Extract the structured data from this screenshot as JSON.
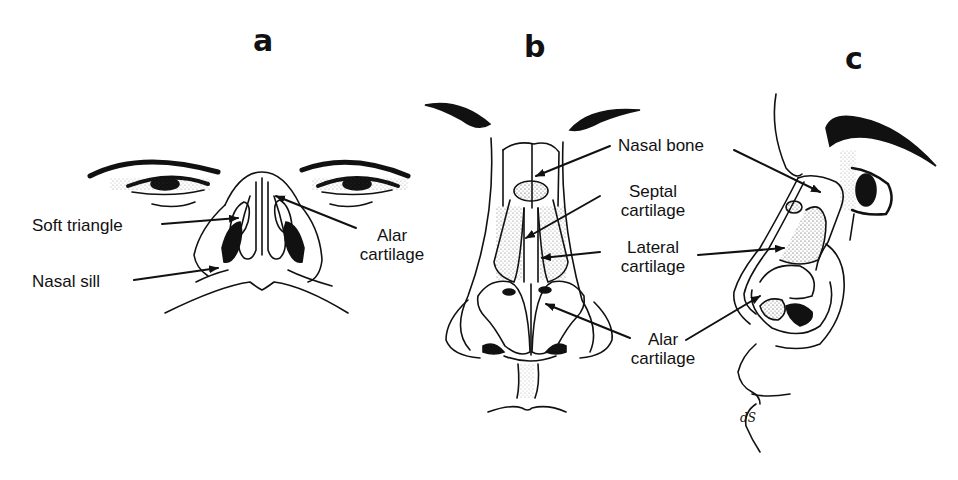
{
  "figure": {
    "panels": [
      {
        "id": "a",
        "letter": "a",
        "view": "basal (inferior) view",
        "labels": {
          "soft_triangle": "Soft triangle",
          "nasal_sill": "Nasal sill",
          "alar_cartilage_line1": "Alar",
          "alar_cartilage_line2": "cartilage"
        }
      },
      {
        "id": "b",
        "letter": "b",
        "view": "frontal view",
        "labels": {
          "nasal_bone": "Nasal bone",
          "septal_cartilage_line1": "Septal",
          "septal_cartilage_line2": "cartilage",
          "lateral_cartilage_line1": "Lateral",
          "lateral_cartilage_line2": "cartilage",
          "alar_cartilage_line1": "Alar",
          "alar_cartilage_line2": "cartilage"
        }
      },
      {
        "id": "c",
        "letter": "c",
        "view": "lateral (profile) view"
      }
    ],
    "colors": {
      "ink": "#111111",
      "background": "#ffffff"
    }
  }
}
